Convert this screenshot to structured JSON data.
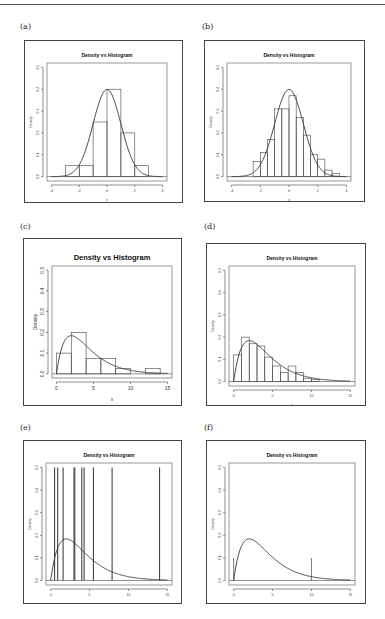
{
  "figure": {
    "panel_labels": [
      "(a)",
      "(b)",
      "(c)",
      "(d)",
      "(e)",
      "(f)"
    ]
  },
  "chart_data": [
    {
      "id": "a",
      "type": "bar",
      "title": "Density vs Histogram",
      "xlabel": "x",
      "ylabel": "Density",
      "xlim": [
        -4,
        4
      ],
      "ylim": [
        0,
        0.5
      ],
      "xticks": [
        -4,
        -2,
        0,
        2,
        4
      ],
      "yticks": [
        0.0,
        0.1,
        0.2,
        0.3,
        0.4,
        0.5
      ],
      "bins": [
        {
          "from": -3,
          "to": -2,
          "density": 0.05
        },
        {
          "from": -2,
          "to": -1,
          "density": 0.05
        },
        {
          "from": -1,
          "to": 0,
          "density": 0.25
        },
        {
          "from": 0,
          "to": 1,
          "density": 0.4
        },
        {
          "from": 1,
          "to": 2,
          "density": 0.2
        },
        {
          "from": 2,
          "to": 3,
          "density": 0.05
        }
      ],
      "curve": "normal(0,1)",
      "spikes": []
    },
    {
      "id": "b",
      "type": "bar",
      "title": "Density vs Histogram",
      "xlabel": "x",
      "ylabel": "Density",
      "xlim": [
        -4,
        4
      ],
      "ylim": [
        0,
        0.5
      ],
      "xticks": [
        -4,
        -2,
        0,
        2,
        4
      ],
      "yticks": [
        0.0,
        0.1,
        0.2,
        0.3,
        0.4,
        0.5
      ],
      "bins": [
        {
          "from": -2.5,
          "to": -2.0,
          "density": 0.07
        },
        {
          "from": -2.0,
          "to": -1.5,
          "density": 0.11
        },
        {
          "from": -1.5,
          "to": -1.0,
          "density": 0.17
        },
        {
          "from": -1.0,
          "to": -0.5,
          "density": 0.31
        },
        {
          "from": -0.5,
          "to": 0.0,
          "density": 0.31
        },
        {
          "from": 0.0,
          "to": 0.5,
          "density": 0.37
        },
        {
          "from": 0.5,
          "to": 1.0,
          "density": 0.27
        },
        {
          "from": 1.0,
          "to": 1.5,
          "density": 0.19
        },
        {
          "from": 1.5,
          "to": 2.0,
          "density": 0.1
        },
        {
          "from": 2.0,
          "to": 2.5,
          "density": 0.08
        },
        {
          "from": 2.5,
          "to": 3.0,
          "density": 0.03
        },
        {
          "from": 3.0,
          "to": 3.5,
          "density": 0.015
        }
      ],
      "curve": "normal(0,1)",
      "spikes": []
    },
    {
      "id": "c",
      "type": "bar",
      "title": "Density vs Histogram",
      "xlabel": "x",
      "ylabel": "Density",
      "xlim": [
        0,
        15
      ],
      "ylim": [
        0,
        0.5
      ],
      "xticks": [
        0,
        5,
        10,
        15
      ],
      "yticks": [
        0.0,
        0.1,
        0.2,
        0.3,
        0.4,
        0.5
      ],
      "bins": [
        {
          "from": 0,
          "to": 2,
          "density": 0.1
        },
        {
          "from": 2,
          "to": 4,
          "density": 0.2
        },
        {
          "from": 4,
          "to": 6,
          "density": 0.075
        },
        {
          "from": 6,
          "to": 8,
          "density": 0.075
        },
        {
          "from": 8,
          "to": 10,
          "density": 0.025
        },
        {
          "from": 10,
          "to": 12,
          "density": 0.0
        },
        {
          "from": 12,
          "to": 14,
          "density": 0.025
        }
      ],
      "curve": "chisq(4)",
      "spikes": []
    },
    {
      "id": "d",
      "type": "bar",
      "title": "Density vs Histogram",
      "xlabel": "x",
      "ylabel": "Density",
      "xlim": [
        0,
        15
      ],
      "ylim": [
        0,
        0.5
      ],
      "xticks": [
        0,
        5,
        10,
        15
      ],
      "yticks": [
        0.0,
        0.1,
        0.2,
        0.3,
        0.4,
        0.5
      ],
      "bins": [
        {
          "from": 0,
          "to": 1,
          "density": 0.12
        },
        {
          "from": 1,
          "to": 2,
          "density": 0.2
        },
        {
          "from": 2,
          "to": 3,
          "density": 0.17
        },
        {
          "from": 3,
          "to": 4,
          "density": 0.16
        },
        {
          "from": 4,
          "to": 5,
          "density": 0.11
        },
        {
          "from": 5,
          "to": 6,
          "density": 0.07
        },
        {
          "from": 6,
          "to": 7,
          "density": 0.04
        },
        {
          "from": 7,
          "to": 8,
          "density": 0.07
        },
        {
          "from": 8,
          "to": 9,
          "density": 0.04
        },
        {
          "from": 9,
          "to": 10,
          "density": 0.015
        },
        {
          "from": 10,
          "to": 11,
          "density": 0.01
        }
      ],
      "curve": "chisq(4)",
      "spikes": []
    },
    {
      "id": "e",
      "type": "bar",
      "title": "Density vs Histogram",
      "xlabel": "x",
      "ylabel": "Density",
      "xlim": [
        0,
        15
      ],
      "ylim": [
        0,
        0.5
      ],
      "xticks": [
        0,
        5,
        10,
        15
      ],
      "yticks": [
        0.0,
        0.1,
        0.2,
        0.3,
        0.4,
        0.5
      ],
      "bins": [],
      "curve": "chisq(4)",
      "spikes": [
        {
          "x": 0.5,
          "height": 0.5
        },
        {
          "x": 0.9,
          "height": 0.5
        },
        {
          "x": 1.6,
          "height": 0.5
        },
        {
          "x": 3.0,
          "height": 0.5
        },
        {
          "x": 3.1,
          "height": 0.5
        },
        {
          "x": 4.0,
          "height": 0.5
        },
        {
          "x": 4.3,
          "height": 0.5
        },
        {
          "x": 5.5,
          "height": 0.5
        },
        {
          "x": 7.9,
          "height": 0.5
        },
        {
          "x": 14.0,
          "height": 0.5
        }
      ]
    },
    {
      "id": "f",
      "type": "bar",
      "title": "Density vs Histogram",
      "xlabel": "x",
      "ylabel": "Density",
      "xlim": [
        0,
        15
      ],
      "ylim": [
        0,
        0.5
      ],
      "xticks": [
        0,
        5,
        10,
        15
      ],
      "yticks": [
        0.0,
        0.1,
        0.2,
        0.3,
        0.4,
        0.5
      ],
      "bins": [],
      "curve": "chisq(4)",
      "spikes": [
        {
          "x": 0.0,
          "height": 0.1
        },
        {
          "x": 10.0,
          "height": 0.1
        }
      ]
    }
  ]
}
